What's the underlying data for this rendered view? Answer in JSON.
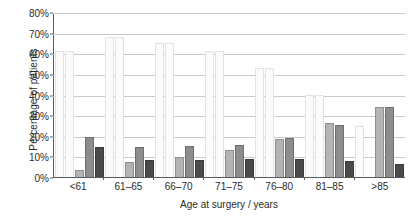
{
  "chart_data": {
    "type": "bar",
    "title": "",
    "xlabel": "Age at surgery / years",
    "ylabel": "Percentage of patients",
    "categories": [
      "<61",
      "61–65",
      "66–70",
      "71–75",
      "76–80",
      "81–85",
      ">85"
    ],
    "ylim": [
      0,
      80
    ],
    "ytick_labels": [
      "0%",
      "10%",
      "20%",
      "30%",
      "40%",
      "50%",
      "60%",
      "70%",
      "80%"
    ],
    "ytick_values": [
      0,
      10,
      20,
      30,
      40,
      50,
      60,
      70,
      80
    ],
    "grid": true,
    "legend": "none",
    "series": [
      {
        "name": "series-1",
        "color": "#fbfbfb",
        "values": [
          61.4,
          68.4,
          65.5,
          61.4,
          53.0,
          39.8,
          24.7
        ]
      },
      {
        "name": "series-2",
        "color": "#fbfbfb",
        "values": [
          61.4,
          68.4,
          65.5,
          61.4,
          53.0,
          39.8,
          0.0
        ]
      },
      {
        "name": "series-3",
        "color": "#b4b4b4",
        "values": [
          3.5,
          7.5,
          10.0,
          13.2,
          18.5,
          26.5,
          34.0
        ]
      },
      {
        "name": "series-4",
        "color": "#8d8d8d",
        "values": [
          19.3,
          14.8,
          15.0,
          15.8,
          19.0,
          25.5,
          34.0
        ]
      },
      {
        "name": "series-5",
        "color": "#4a4a4a",
        "values": [
          14.5,
          8.5,
          8.2,
          8.7,
          8.9,
          7.8,
          6.3
        ]
      }
    ]
  }
}
